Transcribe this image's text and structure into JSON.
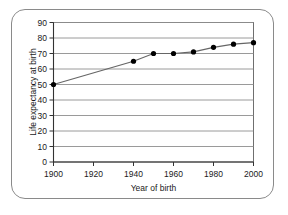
{
  "chart_data": {
    "type": "line",
    "title": "",
    "xlabel": "Year of birth",
    "ylabel": "Life expectancy at birth",
    "xlim": [
      1900,
      2000
    ],
    "ylim": [
      0,
      90
    ],
    "xticks": [
      1900,
      1920,
      1940,
      1960,
      1980,
      2000
    ],
    "xtick_labels": [
      "1900",
      "1920",
      "1940",
      "1960",
      "1980",
      "2000"
    ],
    "yticks": [
      0,
      10,
      20,
      30,
      40,
      50,
      60,
      70,
      80,
      90
    ],
    "ytick_labels": [
      "0",
      "10",
      "20",
      "30",
      "40",
      "50",
      "60",
      "70",
      "80",
      "90"
    ],
    "grid": "horizontal",
    "legend": "none",
    "series": [
      {
        "name": "Life expectancy at birth",
        "marker": "filled-circle",
        "line_color": "#666666",
        "marker_color": "#000000",
        "x": [
          1900,
          1940,
          1950,
          1960,
          1970,
          1980,
          1990,
          2000
        ],
        "values": [
          50,
          65,
          70,
          70,
          71,
          74,
          76,
          77
        ]
      }
    ]
  },
  "figure": {
    "border_color": "#8a8a8a",
    "background": "#ffffff",
    "axis_color": "#333333",
    "gridline_color": "#8f8f8f"
  }
}
